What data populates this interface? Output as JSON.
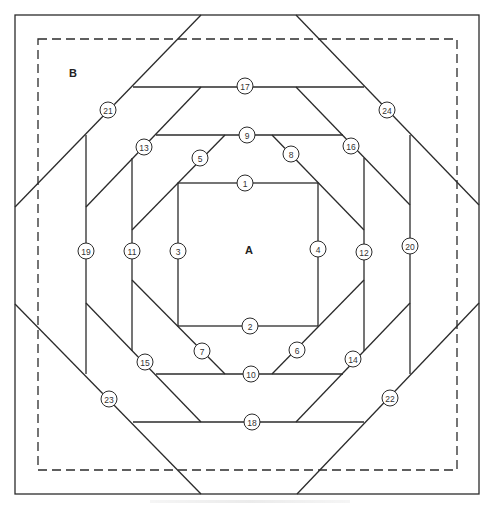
{
  "diagram": {
    "piece_labels": [
      {
        "id": "center",
        "text": "A"
      },
      {
        "id": "corner",
        "text": "B"
      }
    ],
    "sewing_order_labels": [
      "1",
      "2",
      "3",
      "4",
      "5",
      "6",
      "7",
      "8",
      "9",
      "10",
      "11",
      "12",
      "13",
      "14",
      "15",
      "16",
      "17",
      "18",
      "19",
      "20",
      "21",
      "22",
      "23",
      "24"
    ],
    "colors": {
      "line": "#2b2b2b",
      "background": "#ffffff",
      "text": "#333333"
    }
  }
}
